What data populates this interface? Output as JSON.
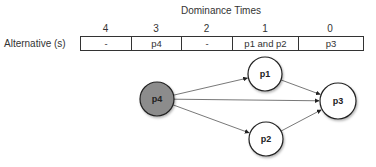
{
  "title": "Dominance Times",
  "table": {
    "row_label": "Alternative (s)",
    "columns": [
      {
        "header": "4",
        "value": "-",
        "width": 51
      },
      {
        "header": "3",
        "value": "p4",
        "width": 50
      },
      {
        "header": "2",
        "value": "-",
        "width": 51
      },
      {
        "header": "1",
        "value": "p1 and p2",
        "width": 66
      },
      {
        "header": "0",
        "value": "p3",
        "width": 64
      }
    ]
  },
  "graph": {
    "nodes": [
      {
        "id": "p4",
        "label": "p4",
        "cx": 157,
        "cy": 99,
        "r": 17,
        "fill": "#8c8c8c"
      },
      {
        "id": "p1",
        "label": "p1",
        "cx": 265,
        "cy": 74,
        "r": 17,
        "fill": "#ffffff"
      },
      {
        "id": "p2",
        "label": "p2",
        "cx": 266,
        "cy": 139,
        "r": 17,
        "fill": "#ffffff"
      },
      {
        "id": "p3",
        "label": "p3",
        "cx": 338,
        "cy": 101,
        "r": 18,
        "fill": "#ffffff"
      }
    ],
    "edges": [
      {
        "from": "p4",
        "to": "p1"
      },
      {
        "from": "p4",
        "to": "p3"
      },
      {
        "from": "p4",
        "to": "p2"
      },
      {
        "from": "p1",
        "to": "p3"
      },
      {
        "from": "p2",
        "to": "p3"
      }
    ],
    "colors": {
      "edge": "#555555",
      "node_stroke": "#222222",
      "highlight_fill": "#8c8c8c"
    }
  }
}
